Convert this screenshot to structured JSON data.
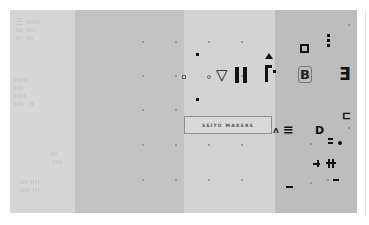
{
  "canvas": {
    "panels": [
      {
        "name": "panel-1",
        "color": "#d6d6d6"
      },
      {
        "name": "panel-2",
        "color": "#c2c2c2"
      },
      {
        "name": "panel-3",
        "color": "#d3d3d3"
      },
      {
        "name": "panel-4",
        "color": "#bdbdbd"
      }
    ],
    "faint_text": {
      "block1": "三 ıııııı\nııı ıııı\nııı ııı",
      "block2": "ıııııı\nıııı\nııııı\nıııı  ıı",
      "block3": "ııı\n ıııı",
      "block4": "ııı ıııı\nıııı ııı"
    }
  },
  "label": {
    "text": "SEITO MAKERS"
  },
  "glyphs": {
    "triangle_down": "▽",
    "pause": "II",
    "b_letter": "B",
    "three": "Ǝ",
    "three_lines": "≡",
    "d_letter": "D",
    "small_triangle_up": "▲",
    "hook": "ㄷ"
  }
}
